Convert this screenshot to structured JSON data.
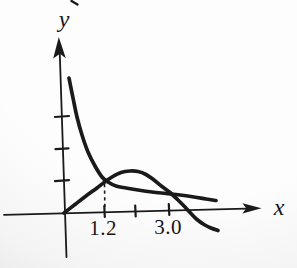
{
  "labels": {
    "y_axis": "y",
    "x_axis": "x",
    "tick_1_2": "1.2",
    "tick_3_0": "3.0"
  },
  "colors": {
    "ink": "#1a1a1a",
    "paper_light": "#fdfdfd",
    "paper_shade": "#c9c9c9"
  },
  "chart_data": {
    "type": "line",
    "title": "",
    "xlabel": "x",
    "ylabel": "y",
    "grid": false,
    "legend": null,
    "xlim": [
      -1.7,
      5.5
    ],
    "ylim": [
      -1.7,
      5.5
    ],
    "x_ticks": [
      1.2,
      2.1,
      3.0
    ],
    "x_tick_labels": [
      "1.2",
      "",
      "3.0"
    ],
    "y_ticks": [
      1,
      2,
      3
    ],
    "y_tick_labels": [
      "",
      "",
      ""
    ],
    "annotations": [
      {
        "type": "dashed-vertical-guide",
        "x": 1.2,
        "from_y": 0,
        "to_y": 0.95,
        "note": "marks intersection of the two curves above x = 1.2"
      }
    ],
    "series": [
      {
        "name": "decreasing-curve",
        "style": "solid",
        "points": [
          [
            0.14,
            4.22
          ],
          [
            0.25,
            3.59
          ],
          [
            0.36,
            3.0
          ],
          [
            0.5,
            2.44
          ],
          [
            0.66,
            1.91
          ],
          [
            0.86,
            1.47
          ],
          [
            1.05,
            1.13
          ],
          [
            1.22,
            0.97
          ],
          [
            1.44,
            0.84
          ],
          [
            1.72,
            0.78
          ],
          [
            2.05,
            0.72
          ],
          [
            2.44,
            0.66
          ],
          [
            2.83,
            0.61
          ],
          [
            3.21,
            0.56
          ],
          [
            3.6,
            0.5
          ],
          [
            3.93,
            0.44
          ],
          [
            4.21,
            0.39
          ]
        ]
      },
      {
        "name": "hump-curve",
        "style": "solid",
        "points": [
          [
            0,
            0
          ],
          [
            0.3,
            0.27
          ],
          [
            0.61,
            0.53
          ],
          [
            0.91,
            0.78
          ],
          [
            1.11,
            0.95
          ],
          [
            1.33,
            1.13
          ],
          [
            1.58,
            1.27
          ],
          [
            1.83,
            1.31
          ],
          [
            2.05,
            1.3
          ],
          [
            2.27,
            1.2
          ],
          [
            2.49,
            1.03
          ],
          [
            2.71,
            0.83
          ],
          [
            2.94,
            0.64
          ],
          [
            3.16,
            0.41
          ],
          [
            3.35,
            0.19
          ],
          [
            3.52,
            -0.02
          ],
          [
            3.68,
            -0.2
          ],
          [
            3.88,
            -0.36
          ],
          [
            4.07,
            -0.47
          ],
          [
            4.27,
            -0.55
          ]
        ]
      }
    ]
  },
  "geometry": {
    "view": [
      297,
      268
    ],
    "lines": [
      {
        "name": "y-axis",
        "x1": 66.5,
        "y1": 257,
        "x2": 59.8,
        "y2": 54,
        "w": 1.8
      },
      {
        "name": "x-axis",
        "x1": 4,
        "y1": 214.8,
        "x2": 246,
        "y2": 208.6,
        "w": 1.8
      },
      {
        "name": "y-tick-1",
        "x1": 55,
        "y1": 181.2,
        "x2": 69,
        "y2": 180.2,
        "w": 2.2
      },
      {
        "name": "y-tick-2",
        "x1": 55.5,
        "y1": 149.2,
        "x2": 68.5,
        "y2": 148.4,
        "w": 2.2
      },
      {
        "name": "y-tick-3",
        "x1": 55,
        "y1": 117,
        "x2": 69,
        "y2": 116,
        "w": 2.2
      },
      {
        "name": "x-tick-1-2",
        "x1": 104.3,
        "y1": 206,
        "x2": 104.8,
        "y2": 217,
        "w": 2.2
      },
      {
        "name": "x-tick-mid",
        "x1": 135.2,
        "y1": 205.5,
        "x2": 135.7,
        "y2": 216.5,
        "w": 2.2
      },
      {
        "name": "x-tick-3-0",
        "x1": 168.8,
        "y1": 204,
        "x2": 169.3,
        "y2": 215,
        "w": 2.2
      },
      {
        "name": "page-crop-artifact",
        "x1": 71.5,
        "y1": 1,
        "x2": 77.5,
        "y2": 4.5,
        "w": 2.4
      }
    ],
    "dashed": {
      "name": "guide-dashed-x-1-2",
      "x1": 104.5,
      "y1": 184,
      "x2": 104.9,
      "y2": 210.5,
      "w": 1.6,
      "dash": "3.2,3.4"
    },
    "arrows": [
      {
        "name": "y-axis-arrowhead",
        "points": "58.8,37 53.2,58.5 59.9,53.8 65.8,58.2"
      },
      {
        "name": "x-axis-arrowhead",
        "points": "261.5,208.3 242.5,203.2 246.2,208.3 242.5,213.5"
      }
    ],
    "curves": [
      {
        "name": "decreasing-curve",
        "w": 3.7,
        "pts": [
          [
            69,
            78
          ],
          [
            73,
            98
          ],
          [
            77,
            117
          ],
          [
            82,
            135
          ],
          [
            88,
            152
          ],
          [
            95,
            166
          ],
          [
            102,
            177
          ],
          [
            108,
            182
          ],
          [
            116,
            186
          ],
          [
            126,
            188
          ],
          [
            138,
            190
          ],
          [
            152,
            192
          ],
          [
            166,
            193.5
          ],
          [
            180,
            195
          ],
          [
            194,
            197
          ],
          [
            206,
            199
          ],
          [
            216,
            200.5
          ]
        ]
      },
      {
        "name": "hump-curve",
        "w": 3.7,
        "pts": [
          [
            64,
            213
          ],
          [
            75,
            204.5
          ],
          [
            86,
            196
          ],
          [
            97,
            188
          ],
          [
            104,
            182.5
          ],
          [
            112,
            177
          ],
          [
            121,
            172.5
          ],
          [
            130,
            171
          ],
          [
            138,
            171.5
          ],
          [
            146,
            174.5
          ],
          [
            154,
            180
          ],
          [
            162,
            186.5
          ],
          [
            170,
            192.5
          ],
          [
            178,
            200
          ],
          [
            185,
            207
          ],
          [
            191,
            213.5
          ],
          [
            197,
            219.5
          ],
          [
            204,
            224.5
          ],
          [
            211,
            228
          ],
          [
            218,
            230.5
          ]
        ]
      }
    ]
  }
}
